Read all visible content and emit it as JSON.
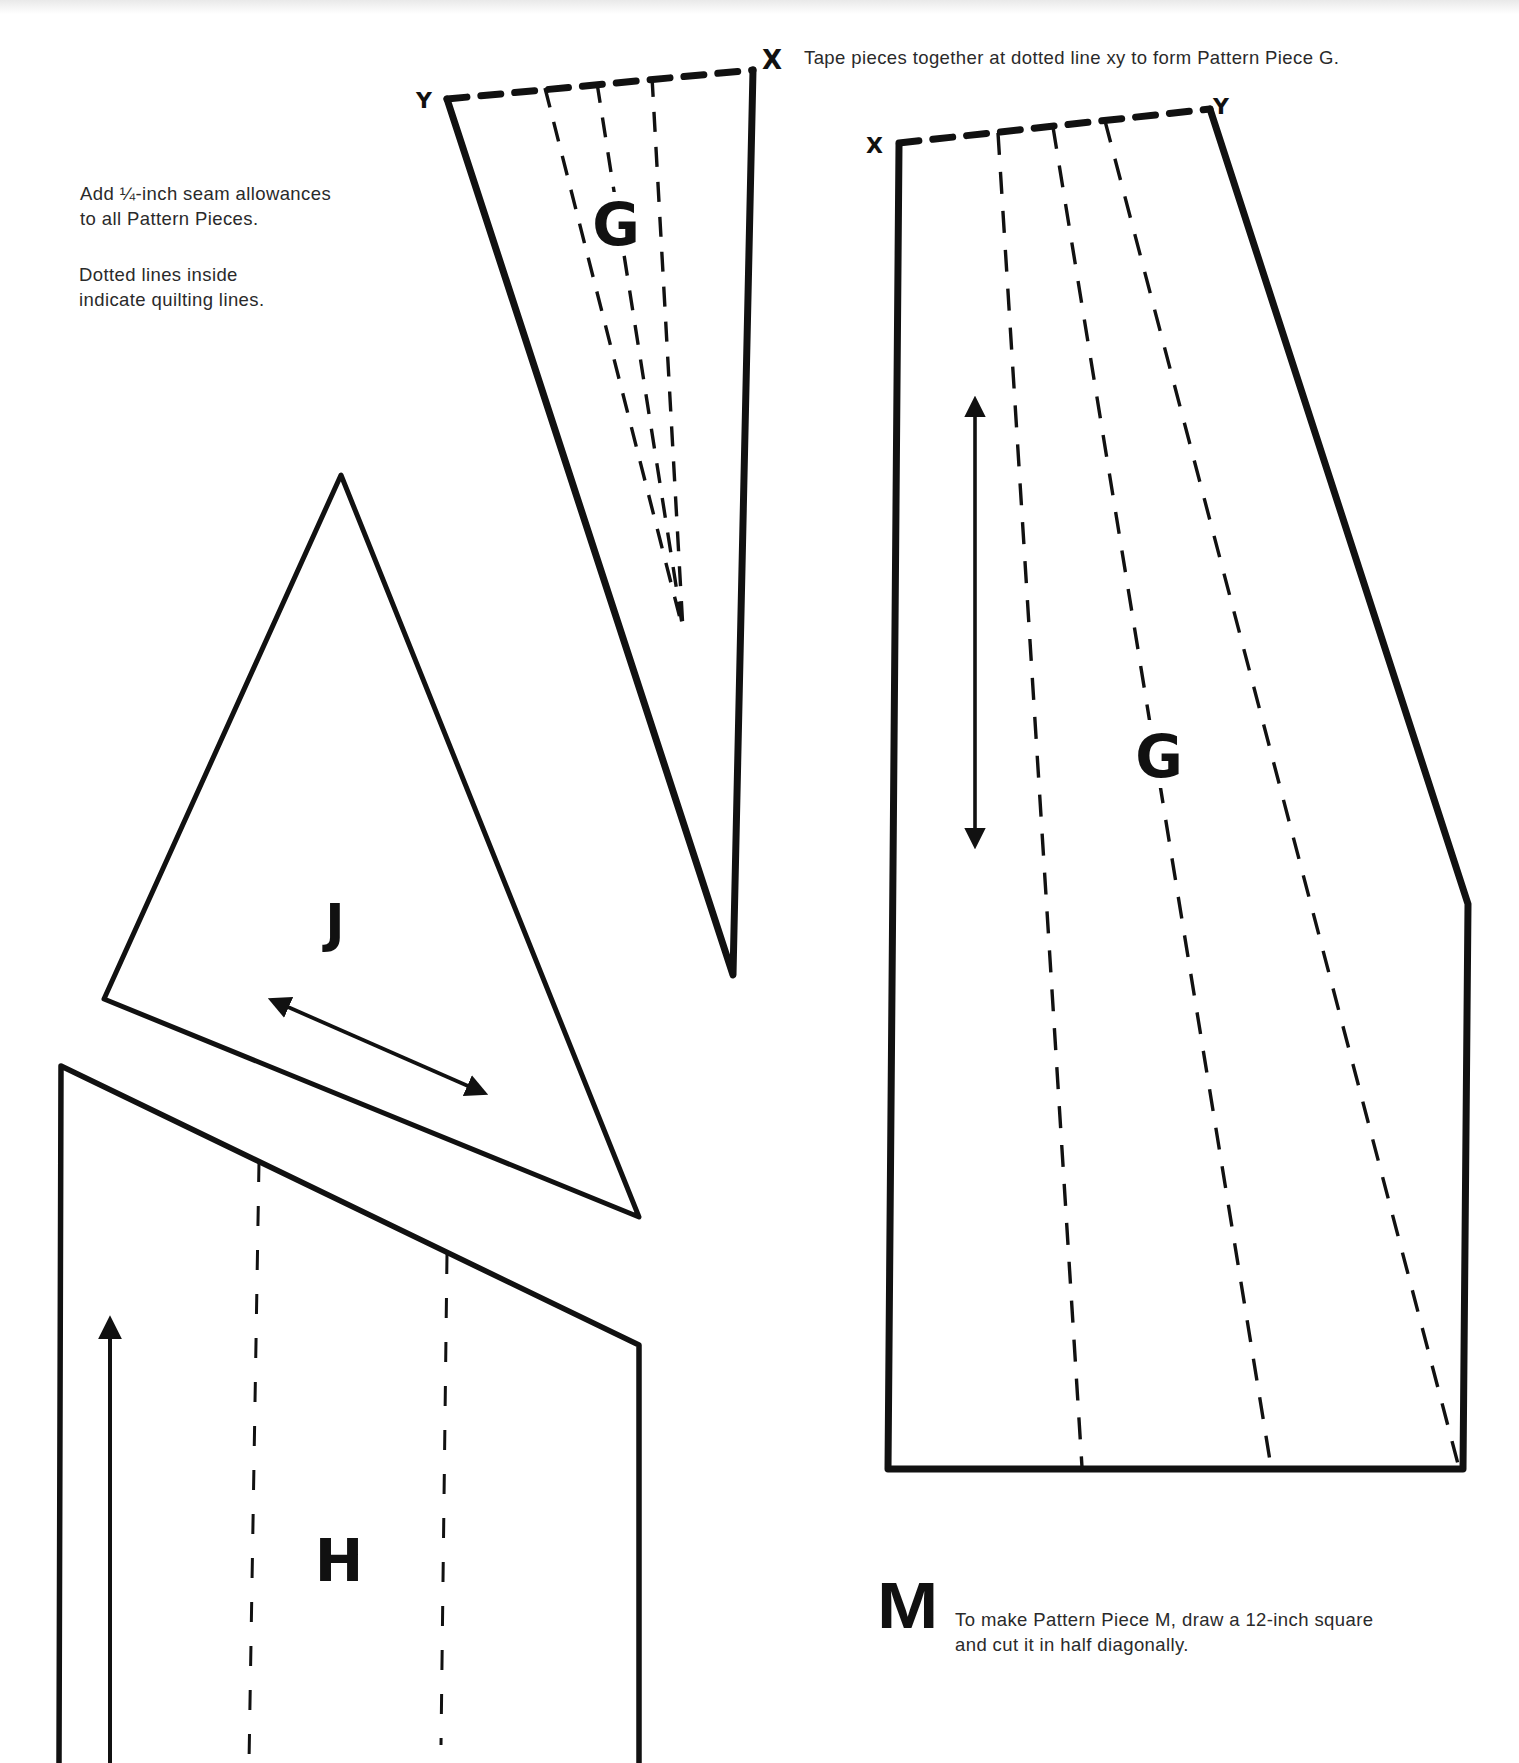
{
  "notes": {
    "seam_allowance": "Add ¼-inch seam allowances\nto all Pattern Pieces.",
    "quilting_lines": "Dotted lines  inside\nindicate quilting lines.",
    "tape_instruction": "Tape pieces together at dotted line xy to form Pattern Piece G.",
    "piece_m_instruction": "To make Pattern Piece M, draw a 12-inch square\nand cut it in half diagonally."
  },
  "labels": {
    "piece_g_top": "G",
    "piece_g_right": "G",
    "piece_j": "J",
    "piece_h": "H",
    "piece_m": "M",
    "tape_marker_x": "X",
    "g_top_corner_y": "Y",
    "g_top_corner_x": "X",
    "g_right_corner_x": "X",
    "g_right_corner_y": "Y"
  },
  "colors": {
    "ink": "#111111",
    "text": "#2a2a2a",
    "paper": "#ffffff"
  },
  "pieces": [
    {
      "id": "G-top",
      "label": "G",
      "quilting_lines": 3,
      "join_edge": "dotted line xy"
    },
    {
      "id": "G-bottom",
      "label": "G",
      "quilting_lines": 3,
      "join_edge": "dotted line xy",
      "grain_arrow": "vertical double-headed"
    },
    {
      "id": "J",
      "label": "J",
      "shape": "triangle",
      "grain_arrow": "diagonal double-headed"
    },
    {
      "id": "H",
      "label": "H",
      "quilting_lines": 2,
      "grain_arrow": "vertical single-headed (up)"
    },
    {
      "id": "M",
      "label": "M",
      "shape": "half of 12-inch square, cut diagonally"
    }
  ]
}
